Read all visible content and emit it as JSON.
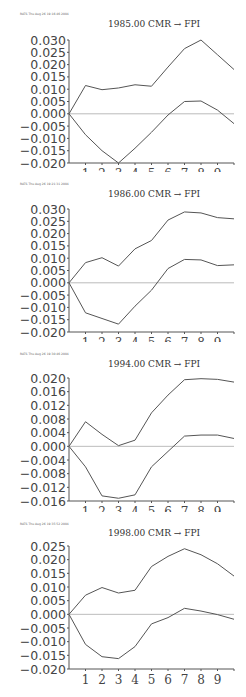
{
  "chart_data": [
    {
      "type": "line",
      "title": "1985.00 CMR → FPI",
      "header": "RATS  Thu Aug 26 19:16:46 2004",
      "x": [
        0,
        1,
        2,
        3,
        4,
        5,
        6,
        7,
        8,
        9,
        10
      ],
      "xticks": [
        "1",
        "2",
        "3",
        "4",
        "5",
        "6",
        "7",
        "8",
        "9"
      ],
      "yticks": [
        "0.030",
        "0.025",
        "0.020",
        "0.015",
        "0.010",
        "0.005",
        "0.000",
        "-0.005",
        "-0.010",
        "-0.015",
        "-0.020"
      ],
      "ylim": [
        -0.02,
        0.03
      ],
      "series": [
        {
          "name": "upper band",
          "values": [
            0,
            0.0115,
            0.0098,
            0.0105,
            0.0118,
            0.0112,
            0.019,
            0.0265,
            0.03,
            0.024,
            0.018
          ]
        },
        {
          "name": "lower band",
          "values": [
            0,
            -0.0085,
            -0.015,
            -0.02,
            -0.014,
            -0.0075,
            -0.0005,
            0.005,
            0.0052,
            0.0015,
            -0.004
          ]
        }
      ]
    },
    {
      "type": "line",
      "title": "1986.00 CMR → FPI",
      "header": "RATS  Thu Aug 26 19:21:31 2004",
      "x": [
        0,
        1,
        2,
        3,
        4,
        5,
        6,
        7,
        8,
        9,
        10
      ],
      "xticks": [
        "1",
        "2",
        "3",
        "4",
        "5",
        "6",
        "7",
        "8",
        "9"
      ],
      "yticks": [
        "0.030",
        "0.025",
        "0.020",
        "0.015",
        "0.010",
        "0.005",
        "0.000",
        "-0.005",
        "-0.010",
        "-0.015",
        "-0.020"
      ],
      "ylim": [
        -0.02,
        0.03
      ],
      "series": [
        {
          "name": "upper band",
          "values": [
            0,
            0.0082,
            0.0102,
            0.0068,
            0.0138,
            0.0172,
            0.0255,
            0.0288,
            0.0284,
            0.0265,
            0.026
          ]
        },
        {
          "name": "lower band",
          "values": [
            0,
            -0.0122,
            -0.0145,
            -0.0168,
            -0.0095,
            -0.003,
            0.0058,
            0.0095,
            0.0093,
            0.007,
            0.0073
          ]
        }
      ]
    },
    {
      "type": "line",
      "title": "1994.00 CMR → FPI",
      "header": "RATS  Thu Aug 26 19:30:46 2004",
      "x": [
        0,
        1,
        2,
        3,
        4,
        5,
        6,
        7,
        8,
        9,
        10
      ],
      "xticks": [
        "1",
        "2",
        "3",
        "4",
        "5",
        "6",
        "7",
        "8",
        "9"
      ],
      "yticks": [
        "0.020",
        "0.016",
        "0.012",
        "0.008",
        "0.004",
        "0.000",
        "-0.004",
        "-0.008",
        "-0.012",
        "-0.016"
      ],
      "ylim": [
        -0.016,
        0.02
      ],
      "series": [
        {
          "name": "upper band",
          "values": [
            0,
            0.0072,
            0.0035,
            0.0002,
            0.0018,
            0.0098,
            0.015,
            0.0195,
            0.0198,
            0.0196,
            0.0188
          ]
        },
        {
          "name": "lower band",
          "values": [
            0,
            -0.006,
            -0.0145,
            -0.0152,
            -0.0142,
            -0.006,
            -0.0015,
            0.003,
            0.0033,
            0.0033,
            0.0023
          ]
        }
      ]
    },
    {
      "type": "line",
      "title": "1998.00 CMR → FPI",
      "header": "RATS  Thu Aug 26 19:35:52 2004",
      "x": [
        0,
        1,
        2,
        3,
        4,
        5,
        6,
        7,
        8,
        9,
        10
      ],
      "xticks": [
        "1",
        "2",
        "3",
        "4",
        "5",
        "6",
        "7",
        "8",
        "9"
      ],
      "yticks": [
        "0.025",
        "0.020",
        "0.015",
        "0.010",
        "0.005",
        "0.000",
        "-0.005",
        "-0.010",
        "-0.015",
        "-0.020"
      ],
      "ylim": [
        -0.02,
        0.025
      ],
      "series": [
        {
          "name": "upper band",
          "values": [
            0,
            0.007,
            0.0098,
            0.0078,
            0.0088,
            0.0175,
            0.0212,
            0.024,
            0.0218,
            0.0185,
            0.014
          ]
        },
        {
          "name": "lower band",
          "values": [
            0,
            -0.011,
            -0.0155,
            -0.0162,
            -0.0118,
            -0.0035,
            -0.0012,
            0.0022,
            0.0012,
            -0.0001,
            -0.0018
          ]
        }
      ]
    }
  ]
}
